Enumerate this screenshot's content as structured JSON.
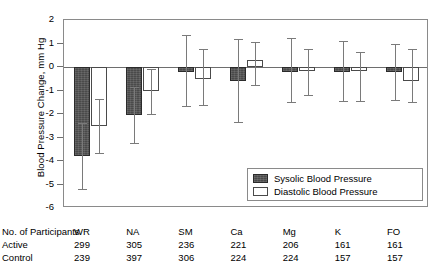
{
  "chart_data": {
    "type": "bar",
    "title": "",
    "xlabel": "",
    "ylabel": "Blood Pressure Change, mm Hg",
    "ylim": [
      -6,
      2
    ],
    "yticks": [
      2,
      1,
      0,
      -1,
      -2,
      -3,
      -4,
      -5,
      -6
    ],
    "ytick_labels": [
      "2",
      "1",
      "0",
      "-1",
      "-2",
      "-3",
      "-4",
      "-5",
      "-6"
    ],
    "grid": false,
    "legend_position": "inside-bottom-right",
    "categories": [
      "WR",
      "NA",
      "SM",
      "Ca",
      "Mg",
      "K",
      "FO"
    ],
    "series": [
      {
        "name": "Sysolic Blood Pressure",
        "color": "#4a4a4a",
        "values": [
          -3.8,
          -2.05,
          -0.2,
          -0.6,
          -0.2,
          -0.2,
          -0.2
        ],
        "ci_low": [
          -5.2,
          -3.25,
          -1.65,
          -2.35,
          -1.5,
          -1.45,
          -1.4
        ],
        "ci_high": [
          -2.4,
          -0.85,
          1.35,
          1.2,
          1.25,
          1.1,
          1.0
        ]
      },
      {
        "name": "Diastolic Blood Pressure",
        "color": "#ffffff",
        "values": [
          -2.5,
          -1.0,
          -0.5,
          0.3,
          -0.15,
          -0.15,
          -0.6
        ],
        "ci_low": [
          -3.65,
          -2.0,
          -1.6,
          -0.75,
          -1.2,
          -1.45,
          -1.5
        ],
        "ci_high": [
          -1.35,
          -0.1,
          0.75,
          1.05,
          0.75,
          0.65,
          0.75
        ]
      }
    ]
  },
  "legend": {
    "items": [
      {
        "label": "Sysolic Blood Pressure",
        "swatch": "filled"
      },
      {
        "label": "Diastolic Blood Pressure",
        "swatch": "open"
      }
    ]
  },
  "table": {
    "header_label": "No. of Participants",
    "active_label": "Active",
    "control_label": "Control",
    "columns": [
      "WR",
      "NA",
      "SM",
      "Ca",
      "Mg",
      "K",
      "FO"
    ],
    "active": [
      "299",
      "305",
      "236",
      "221",
      "206",
      "161",
      "161"
    ],
    "control": [
      "239",
      "397",
      "306",
      "224",
      "224",
      "157",
      "157"
    ]
  }
}
